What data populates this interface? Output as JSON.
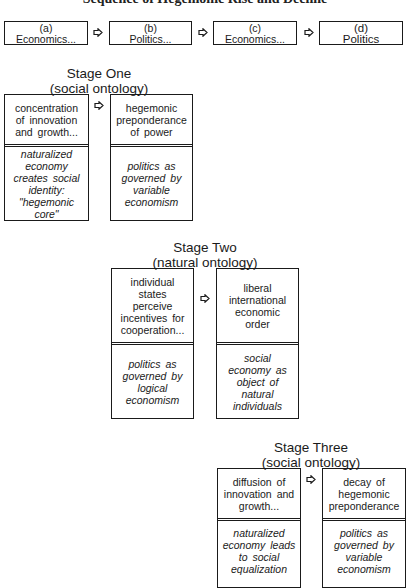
{
  "title": "Sequence of Hegemonic Rise and Decline",
  "sequence": [
    {
      "letter": "(a)",
      "label": "Economics..."
    },
    {
      "letter": "(b)",
      "label": "Politics..."
    },
    {
      "letter": "(c)",
      "label": "Economics..."
    },
    {
      "letter": "(d)",
      "label": "Politics"
    }
  ],
  "stages": [
    {
      "name": "Stage One",
      "ontology": "(social ontology)",
      "boxes": [
        {
          "upper": "concentration\nof innovation\nand growth...",
          "lower": "naturalized\neconomy\ncreates social\nidentity:\n\"hegemonic\ncore\""
        },
        {
          "upper": "hegemonic\npreponderance\nof power",
          "lower": "politics as\ngoverned by\nvariable\neconomism"
        }
      ]
    },
    {
      "name": "Stage Two",
      "ontology": "(natural ontology)",
      "boxes": [
        {
          "upper": "individual\nstates\nperceive\nincentives for\ncooperation...",
          "lower": "politics as\ngoverned by\nlogical\neconomism"
        },
        {
          "upper": "liberal\ninternational\neconomic\norder",
          "lower": "social\neconomy as\nobject of\nnatural\nindividuals"
        }
      ]
    },
    {
      "name": "Stage Three",
      "ontology": "(social ontology)",
      "boxes": [
        {
          "upper": "diffusion of\ninnovation and\ngrowth...",
          "lower": "naturalized\neconomy leads\nto social\nequalization"
        },
        {
          "upper": "decay of\nhegemonic\npreponderance",
          "lower": "politics as\ngoverned by\nvariable\neconomism"
        }
      ]
    }
  ],
  "icons": {
    "arrow": "arrow-right-outline-icon"
  }
}
